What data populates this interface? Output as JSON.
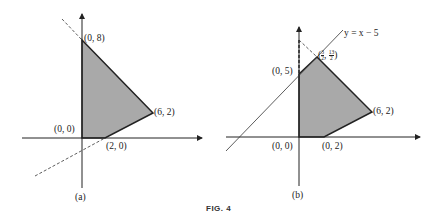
{
  "figure": {
    "caption": "FIG. 4",
    "panels": [
      {
        "id": "a",
        "label": "(a)",
        "vertices": [
          {
            "label": "(0, 8)"
          },
          {
            "label": "(6, 2)"
          },
          {
            "label": "(0, 0)"
          },
          {
            "label": "(2, 0)"
          }
        ]
      },
      {
        "id": "b",
        "label": "(b)",
        "line_label": "y = x − 5",
        "vertices": [
          {
            "label": "(0, 5)"
          },
          {
            "label_prefix": "(",
            "frac1_num": "3",
            "frac1_den": "2",
            "sep": ", ",
            "frac2_num": "13",
            "frac2_den": "2",
            "label_suffix": ")"
          },
          {
            "label": "(6, 2)"
          },
          {
            "label": "(0, 0)"
          },
          {
            "label": "(0, 2)"
          }
        ]
      }
    ]
  },
  "colors": {
    "fill": "#a9a9a9",
    "line": "#333333"
  }
}
